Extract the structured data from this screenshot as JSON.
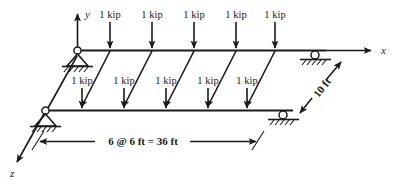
{
  "figure": {
    "background_color": "#ffffff",
    "line_color": "#1a1a1a"
  },
  "axes": {
    "x_label": "x",
    "y_label": "y",
    "z_label": "z"
  },
  "loads": {
    "magnitude_label": "1 kip",
    "top_beam": [
      {
        "label": "1 kip"
      },
      {
        "label": "1 kip"
      },
      {
        "label": "1 kip"
      },
      {
        "label": "1 kip"
      },
      {
        "label": "1 kip"
      }
    ],
    "front_beam": [
      {
        "label": "1 kip"
      },
      {
        "label": "1 kip"
      },
      {
        "label": "1 kip"
      },
      {
        "label": "1 kip"
      },
      {
        "label": "1 kip"
      }
    ]
  },
  "dimensions": {
    "span_label": "6 @ 6 ft = 36 ft",
    "depth_label": "10 ft"
  },
  "supports": {
    "rear_left": "pin-support",
    "rear_right": "roller-support",
    "front_left": "pin-support",
    "front_right": "roller-support"
  }
}
